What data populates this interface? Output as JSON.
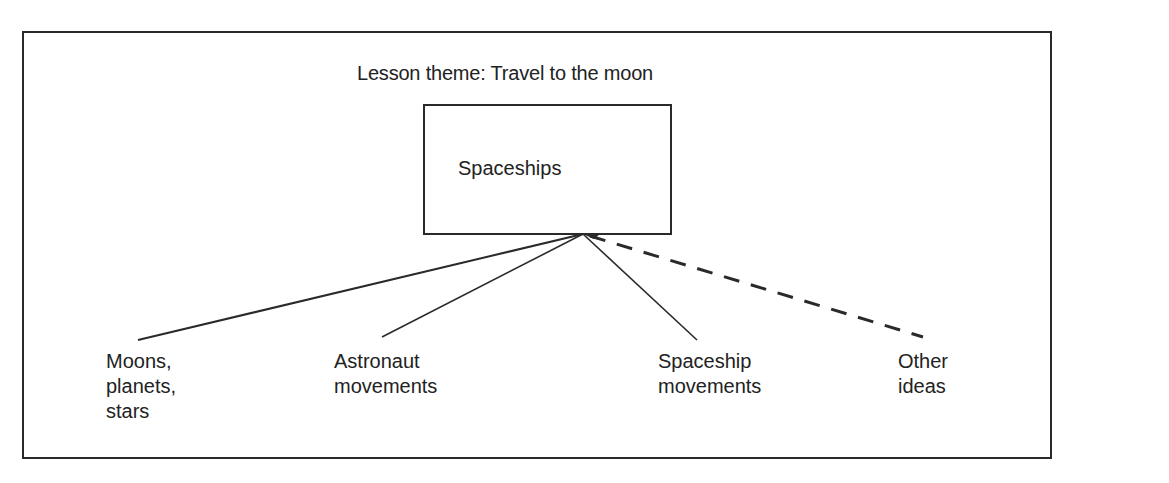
{
  "diagram": {
    "title": "Lesson theme: Travel to the moon",
    "central_node": "Spaceships",
    "branches": [
      {
        "label": "Moons,\nplanets,\nstars",
        "line_style": "solid"
      },
      {
        "label": "Astronaut\nmovements",
        "line_style": "solid"
      },
      {
        "label": "Spaceship\nmovements",
        "line_style": "solid"
      },
      {
        "label": "Other\nideas",
        "line_style": "dashed"
      }
    ],
    "colors": {
      "line": "#2a2a2a",
      "text": "#222222",
      "background": "#ffffff"
    }
  }
}
